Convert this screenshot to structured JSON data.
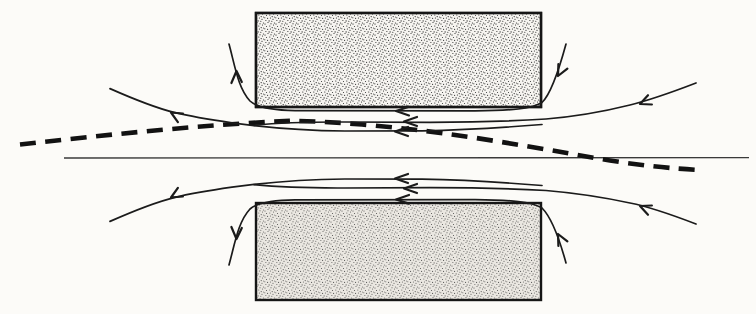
{
  "figure": {
    "type": "streamline-diagram",
    "flow_direction": "right-to-left through the gap",
    "colors": {
      "background": "#fcfbf8",
      "stroke": "#1b1b1b",
      "dashed_line": "#121212",
      "centerline": "#3a3a3a",
      "block_fill": "#eae7e1",
      "block_border": "#161616",
      "stipple_dot": "#3f3f3f"
    },
    "blocks": {
      "upper": {
        "x": 256,
        "y": 13,
        "width": 285,
        "height": 94,
        "texture": "stipple"
      },
      "lower": {
        "x": 256,
        "y": 203,
        "width": 285,
        "height": 97,
        "texture": "stipple"
      }
    },
    "centerline": {
      "x1": 64,
      "y1": 158,
      "x2": 749,
      "y2": 158
    },
    "dashed_line": {
      "start": [
        20,
        144
      ],
      "peak": [
        292,
        121
      ],
      "end": [
        696,
        170
      ],
      "style": "heavy dashes"
    },
    "arrowheads": {
      "count": 14,
      "gap_arrows_upper_y": [
        111,
        122,
        131
      ],
      "gap_arrows_lower_y": [
        179,
        188,
        200
      ],
      "note": "all gap arrows point left; corner wrap arrows point outward on the left side and inward on the right side"
    }
  }
}
